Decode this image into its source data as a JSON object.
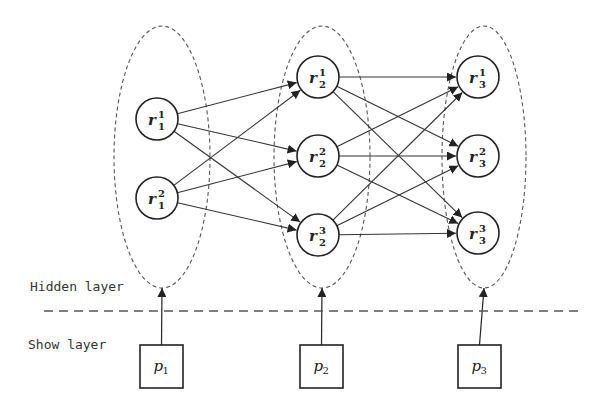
{
  "diagram": {
    "type": "layered-network",
    "layers": {
      "hidden": {
        "label": "Hidden layer"
      },
      "show": {
        "label": "Show layer"
      }
    },
    "colors": {
      "stroke": "#222222",
      "dashed": "#555555",
      "background": "#ffffff"
    },
    "groups": [
      {
        "id": "g1",
        "ellipse": {
          "cx": 162,
          "cy": 157,
          "rx": 48,
          "ry": 131
        },
        "nodes": [
          {
            "id": "r1_1",
            "base": "r",
            "sup": "1",
            "sub": "1",
            "cx": 157,
            "cy": 119
          },
          {
            "id": "r1_2",
            "base": "r",
            "sup": "2",
            "sub": "1",
            "cx": 157,
            "cy": 198
          }
        ],
        "input": {
          "id": "p1",
          "base": "p",
          "sub": "1",
          "x": 140,
          "y": 345,
          "w": 43,
          "h": 43
        }
      },
      {
        "id": "g2",
        "ellipse": {
          "cx": 322,
          "cy": 157,
          "rx": 48,
          "ry": 131
        },
        "nodes": [
          {
            "id": "r2_1",
            "base": "r",
            "sup": "1",
            "sub": "2",
            "cx": 318,
            "cy": 77
          },
          {
            "id": "r2_2",
            "base": "r",
            "sup": "2",
            "sub": "2",
            "cx": 318,
            "cy": 156
          },
          {
            "id": "r2_3",
            "base": "r",
            "sup": "3",
            "sub": "2",
            "cx": 318,
            "cy": 235
          }
        ],
        "input": {
          "id": "p2",
          "base": "p",
          "sub": "2",
          "x": 300,
          "y": 345,
          "w": 43,
          "h": 43
        }
      },
      {
        "id": "g3",
        "ellipse": {
          "cx": 484,
          "cy": 157,
          "rx": 42,
          "ry": 131
        },
        "nodes": [
          {
            "id": "r3_1",
            "base": "r",
            "sup": "1",
            "sub": "3",
            "cx": 478,
            "cy": 77
          },
          {
            "id": "r3_2",
            "base": "r",
            "sup": "2",
            "sub": "3",
            "cx": 478,
            "cy": 156
          },
          {
            "id": "r3_3",
            "base": "r",
            "sup": "3",
            "sub": "3",
            "cx": 478,
            "cy": 233
          }
        ],
        "input": {
          "id": "p3",
          "base": "p",
          "sub": "3",
          "x": 458,
          "y": 345,
          "w": 43,
          "h": 43
        }
      }
    ],
    "node_radius": 21,
    "edges": [
      [
        "r1_1",
        "r2_1"
      ],
      [
        "r1_1",
        "r2_2"
      ],
      [
        "r1_1",
        "r2_3"
      ],
      [
        "r1_2",
        "r2_1"
      ],
      [
        "r1_2",
        "r2_2"
      ],
      [
        "r1_2",
        "r2_3"
      ],
      [
        "r2_1",
        "r3_1"
      ],
      [
        "r2_1",
        "r3_2"
      ],
      [
        "r2_1",
        "r3_3"
      ],
      [
        "r2_2",
        "r3_1"
      ],
      [
        "r2_2",
        "r3_2"
      ],
      [
        "r2_2",
        "r3_3"
      ],
      [
        "r2_3",
        "r3_1"
      ],
      [
        "r2_3",
        "r3_2"
      ],
      [
        "r2_3",
        "r3_3"
      ]
    ],
    "separator": {
      "y": 311,
      "x1": 44,
      "x2": 580
    },
    "label_positions": {
      "hidden": {
        "x": 30,
        "y": 291
      },
      "show": {
        "x": 28,
        "y": 349
      }
    }
  }
}
